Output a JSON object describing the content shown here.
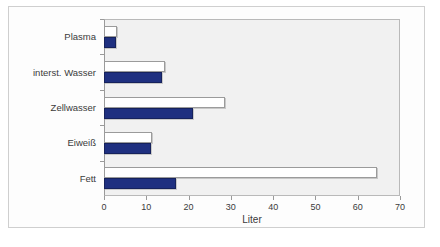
{
  "chart_data": {
    "type": "bar",
    "orientation": "horizontal",
    "title": "",
    "xlabel": "Liter",
    "ylabel": "",
    "xlim": [
      0,
      70
    ],
    "xticks": [
      0,
      10,
      20,
      30,
      40,
      50,
      60,
      70
    ],
    "xticklabels": [
      "0",
      "10",
      "20",
      "30",
      "40",
      "50",
      "60",
      "70"
    ],
    "grid": false,
    "legend": "none",
    "categories": [
      "Plasma",
      "interst. Wasser",
      "Zellwasser",
      "Eiweiß",
      "Fett"
    ],
    "series": [
      {
        "name": "white-series",
        "color": "#ffffff",
        "edge_color": "#9b9b9b",
        "values": [
          3.0,
          14.5,
          28.7,
          11.3,
          64.6
        ]
      },
      {
        "name": "navy-series",
        "color": "#1f3080",
        "edge_color": "#16225c",
        "values": [
          2.8,
          13.7,
          21.0,
          11.0,
          17.0
        ]
      }
    ]
  },
  "figure": {
    "plot_background": "#f1f1f1",
    "frame_color": "#cfcfcf",
    "axis_color": "#9a9a9a",
    "text_color": "#3b3b3b"
  }
}
